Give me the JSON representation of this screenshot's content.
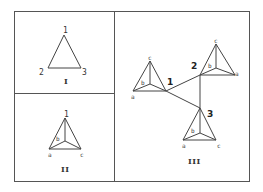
{
  "panels": {
    "I": {
      "label": "I",
      "vertices": {
        "v1": "1",
        "v2": "2",
        "v3": "3"
      }
    },
    "II": {
      "label": "II",
      "vertices": {
        "apex": "1",
        "a": "a",
        "b": "b",
        "c": "c"
      }
    },
    "III": {
      "label": "III",
      "tetrahedra": [
        {
          "id": "1",
          "a": "a",
          "b": "b",
          "c": "c"
        },
        {
          "id": "2",
          "a": "a",
          "b": "b",
          "c": "c"
        },
        {
          "id": "3",
          "a": "a",
          "b": "b",
          "c": "c"
        }
      ]
    }
  }
}
